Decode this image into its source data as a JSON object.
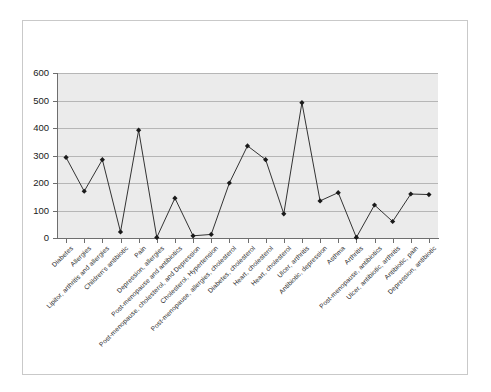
{
  "chart_data": {
    "type": "line",
    "title": "",
    "subtitle": "",
    "xlabel": "",
    "ylabel": "",
    "ylim": [
      0,
      600
    ],
    "ytick_values": [
      0,
      100,
      200,
      300,
      400,
      500,
      600
    ],
    "ytick_labels": [
      "0",
      "100",
      "200",
      "300",
      "400",
      "500",
      "600"
    ],
    "grid": true,
    "legend": false,
    "legend_position": "none",
    "marker": "diamond",
    "line_color": "#333333",
    "marker_color": "#1a1a1a",
    "plot_background": "#ebebeb",
    "categories": [
      "Diabetes",
      "Allergies",
      "Lipitor, arthritis and allergies",
      "Children's antibiotic",
      "Pain",
      "Depression, allergies",
      "Post-menopause and antibiotics",
      "Post-menopause, cholesterol, and Depression",
      "Cholesterol, Hypertension",
      "Post-menopause, allergies, cholesterol",
      "Diabetes, cholesterol",
      "Heart, cholesterol",
      "Heart, cholesterol",
      "Ulcer, arthritis",
      "Antibiotic, depression",
      "Asthma",
      "Arthritis",
      "Post-menopause, antibiotics",
      "Ulcer, antibiotic, arthritis",
      "Antibiotic, pain",
      "Depression, antibiotic"
    ],
    "values": [
      293,
      170,
      285,
      22,
      392,
      2,
      145,
      8,
      13,
      200,
      335,
      285,
      88,
      492,
      135,
      165,
      2,
      120,
      60,
      160,
      158
    ],
    "series": [
      {
        "name": "Series 1",
        "values": [
          293,
          170,
          285,
          22,
          392,
          2,
          145,
          8,
          13,
          200,
          335,
          285,
          88,
          492,
          135,
          165,
          2,
          120,
          60,
          160,
          158
        ]
      }
    ]
  },
  "figure": {
    "border_color": "#c9c9c9",
    "background": "#ffffff"
  }
}
